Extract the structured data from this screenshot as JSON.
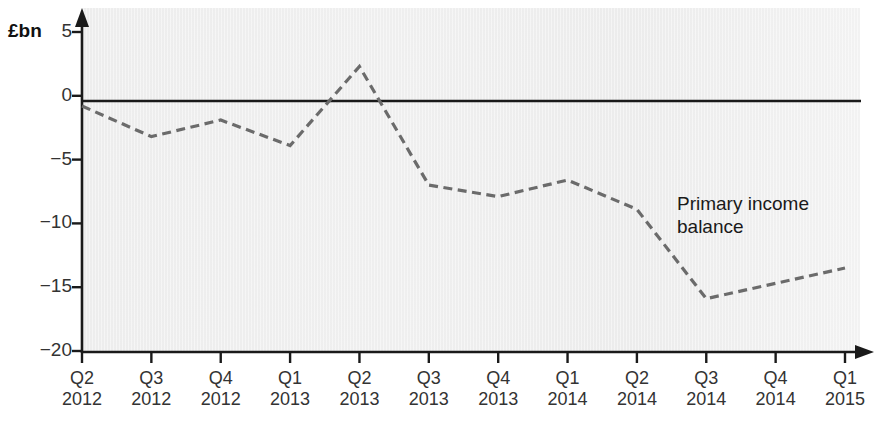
{
  "chart_data": {
    "type": "line",
    "title": "",
    "xlabel": "",
    "ylabel": "£bn",
    "unit_label": "£bn",
    "ylim": [
      -20,
      5
    ],
    "yticks": [
      5,
      0,
      -5,
      -10,
      -15,
      -20
    ],
    "ytick_labels": [
      "5",
      "0",
      "−5",
      "−10",
      "−15",
      "−20"
    ],
    "grid": false,
    "legend": "none",
    "zero_line": true,
    "line_style": "dashed",
    "line_color": "#6b6b6b",
    "axis_color": "#1a1a1a",
    "plot_background": "#ededed",
    "categories": [
      "Q2\n2012",
      "Q3\n2012",
      "Q4\n2012",
      "Q1\n2013",
      "Q2\n2013",
      "Q3\n2013",
      "Q4\n2013",
      "Q1\n2014",
      "Q2\n2014",
      "Q3\n2014",
      "Q4\n2014",
      "Q1\n2015"
    ],
    "x_tick_quarters": [
      "Q2",
      "Q3",
      "Q4",
      "Q1",
      "Q2",
      "Q3",
      "Q4",
      "Q1",
      "Q2",
      "Q3",
      "Q4",
      "Q1"
    ],
    "x_tick_years": [
      "2012",
      "2012",
      "2012",
      "2013",
      "2013",
      "2013",
      "2013",
      "2014",
      "2014",
      "2014",
      "2014",
      "2015"
    ],
    "series": [
      {
        "name": "Primary income balance",
        "values": [
          -0.8,
          -3.2,
          -1.9,
          -3.9,
          2.3,
          -7.0,
          -7.9,
          -6.6,
          -8.9,
          -15.9,
          -14.7,
          -13.5
        ]
      }
    ],
    "annotations": [
      {
        "text": "Primary income\nbalance",
        "x": 8.6,
        "y": -7.0
      }
    ]
  }
}
